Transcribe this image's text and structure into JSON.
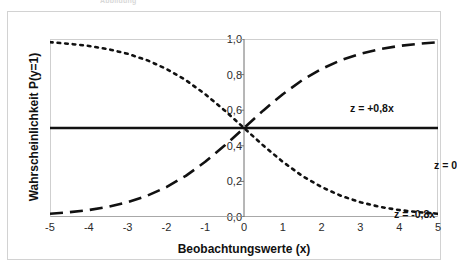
{
  "figure": {
    "top_caption": "Abbildung",
    "frame_color": "#d2d2d2",
    "background": "#ffffff"
  },
  "chart_data": {
    "type": "line",
    "title": "",
    "subtitle": "",
    "xlabel": "Beobachtungswerte (x)",
    "ylabel": "Wahrscheinlichkeit P(y=1)",
    "xlim": [
      -5,
      5
    ],
    "ylim": [
      0.0,
      1.0
    ],
    "grid": false,
    "legend_position": "inline-annotations",
    "xticks": [
      -5,
      -4,
      -3,
      -2,
      -1,
      0,
      1,
      2,
      3,
      4,
      5
    ],
    "xticklabels": [
      "-5",
      "-4",
      "-3",
      "-2",
      "-1",
      "0",
      "1",
      "2",
      "3",
      "4",
      "5"
    ],
    "yticks": [
      0.0,
      0.2,
      0.4,
      0.6,
      0.8,
      1.0
    ],
    "yticklabels": [
      "0,0",
      "0,2",
      "0,4",
      "0,6",
      "0,8",
      "1,0"
    ],
    "x": [
      -5,
      -4.5,
      -4,
      -3.5,
      -3,
      -2.5,
      -2,
      -1.5,
      -1,
      -0.5,
      0,
      0.5,
      1,
      1.5,
      2,
      2.5,
      3,
      3.5,
      4,
      4.5,
      5
    ],
    "series": [
      {
        "name": "z = +0,8x",
        "formula": "P = 1 / (1 + exp(-0.8x))",
        "slope": 0.8,
        "linestyle": "dashed",
        "color": "#111111",
        "linewidth": 2.6,
        "annotation": "z = +0,8x",
        "values": [
          0.018,
          0.027,
          0.039,
          0.057,
          0.083,
          0.119,
          0.168,
          0.231,
          0.31,
          0.401,
          0.5,
          0.599,
          0.69,
          0.769,
          0.832,
          0.881,
          0.917,
          0.943,
          0.961,
          0.973,
          0.982
        ]
      },
      {
        "name": "z = 0",
        "formula": "P = 1 / (1 + exp(0)) = 0,5",
        "slope": 0.0,
        "linestyle": "solid",
        "color": "#111111",
        "linewidth": 2.6,
        "annotation": "z = 0",
        "values": [
          0.5,
          0.5,
          0.5,
          0.5,
          0.5,
          0.5,
          0.5,
          0.5,
          0.5,
          0.5,
          0.5,
          0.5,
          0.5,
          0.5,
          0.5,
          0.5,
          0.5,
          0.5,
          0.5,
          0.5,
          0.5
        ]
      },
      {
        "name": "z = -0,8x",
        "formula": "P = 1 / (1 + exp(0.8x))",
        "slope": -0.8,
        "linestyle": "dotted",
        "color": "#111111",
        "linewidth": 2.6,
        "annotation": "z = -0,8x",
        "values": [
          0.982,
          0.973,
          0.961,
          0.943,
          0.917,
          0.881,
          0.832,
          0.769,
          0.69,
          0.599,
          0.5,
          0.401,
          0.31,
          0.231,
          0.168,
          0.119,
          0.083,
          0.057,
          0.039,
          0.027,
          0.018
        ]
      }
    ]
  }
}
